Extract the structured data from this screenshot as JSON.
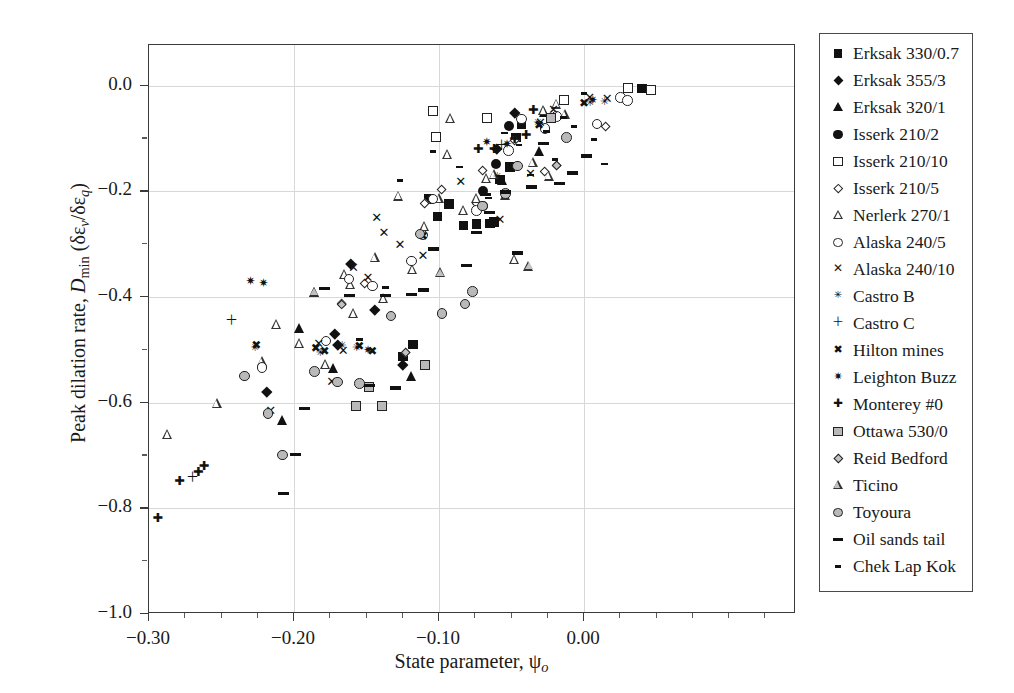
{
  "figure": {
    "background": "#ffffff",
    "frame_color": "#3a3a3a",
    "grid_color": "#d8d8d8"
  },
  "chart_data": {
    "type": "scatter",
    "title": "",
    "xlabel": "State parameter, ψo",
    "ylabel": "Peak dilation rate, Dmin (δεv/δεq)",
    "xlim": [
      -0.3,
      0.1462
    ],
    "ylim": [
      -1.0,
      0.0769
    ],
    "xticks": [
      -0.3,
      -0.2,
      -0.1,
      0.0
    ],
    "xtick_labels": [
      "−0.30",
      "−0.20",
      "−0.10",
      "0.00"
    ],
    "xtick_minor_step": 0.025,
    "yticks": [
      0.0,
      -0.2,
      -0.4,
      -0.6,
      -0.8,
      -1.0
    ],
    "ytick_labels": [
      "0.0",
      "−0.2",
      "−0.4",
      "−0.6",
      "−0.8",
      "−1.0"
    ],
    "ytick_minor_step": 0.05,
    "grid": "major gridlines on both axes, light grey",
    "legend_position": "right, outside plot area",
    "series": [
      {
        "name": "Erksak 330/0.7",
        "marker": "filled-square",
        "points": [
          [
            -0.107,
            -0.215
          ],
          [
            -0.101,
            -0.248
          ],
          [
            -0.093,
            -0.224
          ],
          [
            -0.083,
            -0.265
          ],
          [
            -0.074,
            -0.262
          ],
          [
            -0.065,
            -0.261
          ],
          [
            -0.062,
            -0.258
          ],
          [
            -0.058,
            -0.178
          ],
          [
            -0.051,
            -0.154
          ],
          [
            -0.047,
            -0.098
          ],
          [
            -0.043,
            -0.073
          ],
          [
            -0.125,
            -0.513
          ],
          [
            -0.118,
            -0.49
          ],
          [
            0.04,
            -0.005
          ]
        ]
      },
      {
        "name": "Erksak 355/3",
        "marker": "filled-diamond",
        "points": [
          [
            -0.219,
            -0.579
          ],
          [
            -0.172,
            -0.47
          ],
          [
            -0.17,
            -0.49
          ],
          [
            -0.161,
            -0.338
          ],
          [
            -0.144,
            -0.425
          ],
          [
            -0.125,
            -0.528
          ],
          [
            -0.06,
            -0.119
          ],
          [
            -0.048,
            -0.051
          ]
        ]
      },
      {
        "name": "Erksak 320/1",
        "marker": "filled-triangle",
        "points": [
          [
            -0.208,
            -0.634
          ],
          [
            -0.196,
            -0.461
          ],
          [
            -0.173,
            -0.536
          ],
          [
            -0.119,
            -0.552
          ],
          [
            -0.056,
            -0.18
          ],
          [
            -0.031,
            -0.125
          ],
          [
            -0.027,
            -0.052
          ]
        ]
      },
      {
        "name": "Isserk 210/2",
        "marker": "filled-circle",
        "points": [
          [
            -0.07,
            -0.2
          ],
          [
            -0.07,
            -0.228
          ],
          [
            -0.061,
            -0.148
          ],
          [
            -0.052,
            -0.077
          ]
        ]
      },
      {
        "name": "Isserk 210/10",
        "marker": "open-square",
        "points": [
          [
            -0.104,
            -0.048
          ],
          [
            -0.102,
            -0.097
          ],
          [
            -0.067,
            -0.062
          ],
          [
            -0.014,
            -0.027
          ],
          [
            0.03,
            -0.004
          ],
          [
            0.046,
            -0.008
          ]
        ]
      },
      {
        "name": "Isserk 210/5",
        "marker": "open-diamond",
        "points": [
          [
            -0.167,
            -0.413
          ],
          [
            -0.151,
            -0.375
          ],
          [
            -0.11,
            -0.223
          ],
          [
            -0.098,
            -0.196
          ],
          [
            -0.074,
            -0.224
          ],
          [
            -0.07,
            -0.16
          ],
          [
            -0.048,
            -0.104
          ],
          [
            -0.027,
            -0.162
          ],
          [
            -0.019,
            -0.151
          ],
          [
            0.015,
            -0.078
          ]
        ]
      },
      {
        "name": "Nerlerk 270/1",
        "marker": "open-triangle",
        "points": [
          [
            -0.287,
            -0.662
          ],
          [
            -0.253,
            -0.603
          ],
          [
            -0.222,
            -0.523
          ],
          [
            -0.212,
            -0.453
          ],
          [
            -0.196,
            -0.489
          ],
          [
            -0.186,
            -0.393
          ],
          [
            -0.178,
            -0.529
          ],
          [
            -0.165,
            -0.359
          ],
          [
            -0.161,
            -0.377
          ],
          [
            -0.159,
            -0.432
          ],
          [
            -0.144,
            -0.327
          ],
          [
            -0.138,
            -0.404
          ],
          [
            -0.128,
            -0.21
          ],
          [
            -0.118,
            -0.349
          ],
          [
            -0.11,
            -0.267
          ],
          [
            -0.1,
            -0.214
          ],
          [
            -0.094,
            -0.131
          ],
          [
            -0.092,
            -0.064
          ],
          [
            -0.083,
            -0.238
          ],
          [
            -0.074,
            -0.215
          ],
          [
            -0.067,
            -0.177
          ],
          [
            -0.062,
            -0.17
          ],
          [
            -0.054,
            -0.208
          ],
          [
            -0.048,
            -0.33
          ],
          [
            -0.035,
            -0.146
          ],
          [
            -0.028,
            -0.048
          ],
          [
            -0.024,
            -0.172
          ],
          [
            -0.019,
            -0.036
          ],
          [
            -0.013,
            -0.055
          ]
        ]
      },
      {
        "name": "Alaska 240/5",
        "marker": "open-circle",
        "points": [
          [
            -0.222,
            -0.533
          ],
          [
            -0.178,
            -0.483
          ],
          [
            -0.162,
            -0.366
          ],
          [
            -0.146,
            -0.379
          ],
          [
            -0.119,
            -0.332
          ],
          [
            -0.111,
            -0.283
          ],
          [
            -0.104,
            -0.215
          ],
          [
            -0.074,
            -0.236
          ],
          [
            -0.052,
            -0.123
          ],
          [
            -0.043,
            -0.063
          ],
          [
            -0.027,
            -0.081
          ],
          [
            -0.019,
            -0.058
          ],
          [
            0.009,
            -0.073
          ],
          [
            0.025,
            -0.022
          ],
          [
            0.03,
            -0.028
          ]
        ]
      },
      {
        "name": "Alaska 240/10",
        "marker": "cross-x",
        "points": [
          [
            -0.216,
            -0.617
          ],
          [
            -0.183,
            -0.49
          ],
          [
            -0.174,
            -0.561
          ],
          [
            -0.166,
            -0.504
          ],
          [
            -0.159,
            -0.347
          ],
          [
            -0.149,
            -0.365
          ],
          [
            -0.143,
            -0.251
          ],
          [
            -0.138,
            -0.279
          ],
          [
            -0.127,
            -0.302
          ],
          [
            -0.111,
            -0.323
          ],
          [
            -0.085,
            -0.183
          ],
          [
            -0.058,
            -0.256
          ],
          [
            -0.037,
            -0.169
          ],
          [
            -0.03,
            -0.071
          ],
          [
            -0.021,
            -0.047
          ],
          [
            0.004,
            -0.024
          ],
          [
            0.016,
            -0.027
          ]
        ]
      },
      {
        "name": "Castro B",
        "marker": "star-x",
        "points": [
          [
            -0.227,
            -0.497
          ],
          [
            -0.182,
            -0.507
          ],
          [
            -0.167,
            -0.493
          ],
          [
            -0.157,
            -0.497
          ],
          [
            -0.113,
            -0.284
          ],
          [
            -0.06,
            -0.174
          ],
          [
            -0.032,
            -0.072
          ],
          [
            0.004,
            -0.034
          ],
          [
            0.014,
            -0.032
          ]
        ]
      },
      {
        "name": "Castro C",
        "marker": "plus-thin",
        "points": [
          [
            -0.27,
            -0.741
          ],
          [
            -0.243,
            -0.445
          ],
          [
            -0.057,
            -0.114
          ]
        ]
      },
      {
        "name": "Hilton mines",
        "marker": "bold-x",
        "points": [
          [
            -0.226,
            -0.492
          ],
          [
            -0.185,
            -0.498
          ],
          [
            -0.179,
            -0.504
          ],
          [
            -0.155,
            -0.494
          ],
          [
            -0.146,
            -0.504
          ],
          [
            -0.111,
            -0.286
          ],
          [
            -0.031,
            -0.076
          ],
          [
            0.0,
            -0.035
          ]
        ]
      },
      {
        "name": "Leighton Buzz",
        "marker": "bold-star",
        "points": [
          [
            -0.23,
            -0.371
          ],
          [
            -0.221,
            -0.375
          ],
          [
            -0.149,
            -0.502
          ],
          [
            -0.067,
            -0.109
          ],
          [
            -0.053,
            -0.113
          ],
          [
            0.006,
            -0.03
          ]
        ]
      },
      {
        "name": "Monterey #0",
        "marker": "plus-bold",
        "points": [
          [
            -0.294,
            -0.82
          ],
          [
            -0.279,
            -0.751
          ],
          [
            -0.266,
            -0.734
          ],
          [
            -0.262,
            -0.722
          ],
          [
            -0.073,
            -0.122
          ],
          [
            -0.062,
            -0.122
          ],
          [
            -0.048,
            -0.103
          ],
          [
            -0.04,
            -0.096
          ],
          [
            -0.035,
            -0.048
          ]
        ]
      },
      {
        "name": "Ottawa 530/0",
        "marker": "grey-square",
        "points": [
          [
            -0.157,
            -0.607
          ],
          [
            -0.148,
            -0.57
          ],
          [
            -0.139,
            -0.606
          ],
          [
            -0.11,
            -0.528
          ],
          [
            -0.023,
            -0.062
          ]
        ]
      },
      {
        "name": "Reid Bedford",
        "marker": "grey-diamond",
        "points": [
          [
            -0.167,
            -0.414
          ],
          [
            -0.123,
            -0.506
          ],
          [
            -0.019,
            -0.151
          ]
        ]
      },
      {
        "name": "Ticino",
        "marker": "grey-triangle",
        "points": [
          [
            -0.186,
            -0.392
          ],
          [
            -0.099,
            -0.355
          ],
          [
            -0.038,
            -0.343
          ]
        ]
      },
      {
        "name": "Toyoura",
        "marker": "grey-circle",
        "points": [
          [
            -0.234,
            -0.55
          ],
          [
            -0.218,
            -0.621
          ],
          [
            -0.208,
            -0.699
          ],
          [
            -0.186,
            -0.541
          ],
          [
            -0.17,
            -0.561
          ],
          [
            -0.155,
            -0.564
          ],
          [
            -0.133,
            -0.436
          ],
          [
            -0.113,
            -0.281
          ],
          [
            -0.098,
            -0.431
          ],
          [
            -0.082,
            -0.413
          ],
          [
            -0.077,
            -0.39
          ],
          [
            -0.07,
            -0.228
          ],
          [
            -0.054,
            -0.204
          ],
          [
            -0.046,
            -0.152
          ],
          [
            -0.012,
            -0.098
          ]
        ]
      },
      {
        "name": "Oil sands tail",
        "marker": "dash",
        "points": [
          [
            -0.207,
            -0.772
          ],
          [
            -0.199,
            -0.698
          ],
          [
            -0.193,
            -0.611
          ],
          [
            -0.179,
            -0.384
          ],
          [
            -0.162,
            -0.397
          ],
          [
            -0.148,
            -0.567
          ],
          [
            -0.137,
            -0.397
          ],
          [
            -0.13,
            -0.572
          ],
          [
            -0.119,
            -0.395
          ],
          [
            -0.111,
            -0.387
          ],
          [
            -0.104,
            -0.309
          ],
          [
            -0.081,
            -0.34
          ],
          [
            -0.074,
            -0.278
          ],
          [
            -0.068,
            -0.206
          ],
          [
            -0.065,
            -0.24
          ],
          [
            -0.054,
            -0.201
          ],
          [
            -0.046,
            -0.317
          ],
          [
            -0.036,
            -0.192
          ],
          [
            -0.028,
            -0.11
          ],
          [
            -0.017,
            -0.185
          ],
          [
            -0.008,
            -0.165
          ],
          [
            0.002,
            -0.133
          ]
        ]
      },
      {
        "name": "Chek Lap Kok",
        "marker": "small-dash",
        "points": [
          [
            -0.155,
            -0.48
          ],
          [
            -0.137,
            -0.382
          ],
          [
            -0.127,
            -0.179
          ],
          [
            -0.104,
            -0.125
          ],
          [
            -0.092,
            -0.226
          ],
          [
            -0.086,
            -0.154
          ],
          [
            -0.066,
            -0.213
          ],
          [
            -0.055,
            -0.09
          ],
          [
            -0.045,
            -0.112
          ],
          [
            -0.037,
            -0.169
          ],
          [
            -0.026,
            -0.087
          ],
          [
            -0.02,
            -0.14
          ],
          [
            -0.014,
            -0.06
          ],
          [
            -0.007,
            -0.077
          ],
          [
            0.0,
            -0.015
          ],
          [
            0.007,
            -0.102
          ],
          [
            0.014,
            -0.148
          ]
        ]
      }
    ]
  },
  "legend": {
    "items": [
      {
        "label": "Erksak 330/0.7",
        "marker": "filled-square"
      },
      {
        "label": "Erksak 355/3",
        "marker": "filled-diamond"
      },
      {
        "label": "Erksak 320/1",
        "marker": "filled-triangle"
      },
      {
        "label": "Isserk 210/2",
        "marker": "filled-circle"
      },
      {
        "label": "Isserk 210/10",
        "marker": "open-square"
      },
      {
        "label": "Isserk 210/5",
        "marker": "open-diamond"
      },
      {
        "label": "Nerlerk 270/1",
        "marker": "open-triangle"
      },
      {
        "label": "Alaska 240/5",
        "marker": "open-circle"
      },
      {
        "label": "Alaska 240/10",
        "marker": "cross-x"
      },
      {
        "label": "Castro B",
        "marker": "star-x"
      },
      {
        "label": "Castro C",
        "marker": "plus-thin"
      },
      {
        "label": "Hilton mines",
        "marker": "bold-x"
      },
      {
        "label": "Leighton Buzz",
        "marker": "bold-star"
      },
      {
        "label": "Monterey #0",
        "marker": "plus-bold"
      },
      {
        "label": "Ottawa 530/0",
        "marker": "grey-square"
      },
      {
        "label": "Reid Bedford",
        "marker": "grey-diamond"
      },
      {
        "label": "Ticino",
        "marker": "grey-triangle"
      },
      {
        "label": "Toyoura",
        "marker": "grey-circle"
      },
      {
        "label": "Oil sands tail",
        "marker": "dash"
      },
      {
        "label": "Chek Lap Kok",
        "marker": "small-dash"
      }
    ]
  }
}
